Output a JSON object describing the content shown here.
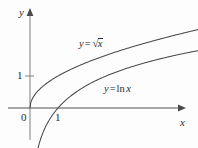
{
  "figure": {
    "background_color": "#fdfdfd",
    "ink_color": "#2b2b2b",
    "axis_color": "#7a7a7a",
    "curve_color": "#4a4a4a"
  },
  "axes": {
    "x_axis_label": "x",
    "y_axis_label": "y",
    "origin_label": "0",
    "x_ticks": [
      {
        "value": "1",
        "label": "1"
      }
    ],
    "y_ticks": [
      {
        "value": "1",
        "label": "1"
      }
    ],
    "x_range": [
      -1.1,
      6.0
    ],
    "y_range": [
      -1.3,
      3.4
    ],
    "grid": false,
    "arrowheads": [
      "x-positive",
      "y-positive"
    ]
  },
  "curves": {
    "sqrt": {
      "label_lead": "y",
      "label_eq": "=",
      "radical_sign": "√",
      "radical_arg": "x",
      "label_plain": "y = √x"
    },
    "ln": {
      "label_lead": "y",
      "label_eq": "=",
      "fn_name": "ln",
      "fn_arg": "x",
      "label_plain": "y = ln x"
    }
  },
  "chart_data": {
    "type": "line",
    "title": "",
    "subtitle": "",
    "xlabel": "x",
    "ylabel": "y",
    "xlim": [
      -1.1,
      6.0
    ],
    "ylim": [
      -1.3,
      3.4
    ],
    "grid": false,
    "legend_position": "inline-annotation",
    "xticks": [
      0,
      1
    ],
    "xticklabels": [
      "0",
      "1"
    ],
    "yticks": [
      1
    ],
    "yticklabels": [
      "1"
    ],
    "annotations": [
      {
        "text": "y = √x",
        "x": 1.75,
        "y": 2.25
      },
      {
        "text": "y = ln x",
        "x": 2.65,
        "y": 0.78
      }
    ],
    "series": [
      {
        "name": "y = √x",
        "formula": "sqrt(x)",
        "color": "#4a4a4a",
        "x": [
          0,
          0.1,
          0.25,
          0.5,
          0.75,
          1,
          1.5,
          2,
          2.5,
          3,
          3.5,
          4,
          4.5,
          5,
          5.5,
          6
        ],
        "values": [
          0,
          0.316,
          0.5,
          0.707,
          0.866,
          1,
          1.225,
          1.414,
          1.581,
          1.732,
          1.871,
          2,
          2.121,
          2.236,
          2.345,
          2.449
        ]
      },
      {
        "name": "y = ln x",
        "formula": "ln(x)",
        "color": "#4a4a4a",
        "x": [
          0.18,
          0.25,
          0.4,
          0.6,
          0.8,
          1,
          1.5,
          2,
          2.5,
          3,
          3.5,
          4,
          4.5,
          5,
          5.5,
          6
        ],
        "values": [
          -1.715,
          -1.386,
          -0.916,
          -0.511,
          -0.223,
          0,
          0.405,
          0.693,
          0.916,
          1.099,
          1.253,
          1.386,
          1.504,
          1.609,
          1.705,
          1.792
        ]
      }
    ]
  }
}
